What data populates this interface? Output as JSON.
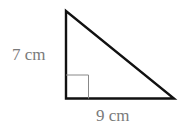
{
  "diagram": {
    "type": "right-triangle",
    "vertical_side": {
      "label": "7 cm",
      "length": 7,
      "unit": "cm"
    },
    "horizontal_side": {
      "label": "9 cm",
      "length": 9,
      "unit": "cm"
    },
    "right_angle_marker": true,
    "colors": {
      "stroke": "#111111",
      "marker": "#888888",
      "label": "#7a7a7a",
      "background": "#ffffff"
    }
  }
}
